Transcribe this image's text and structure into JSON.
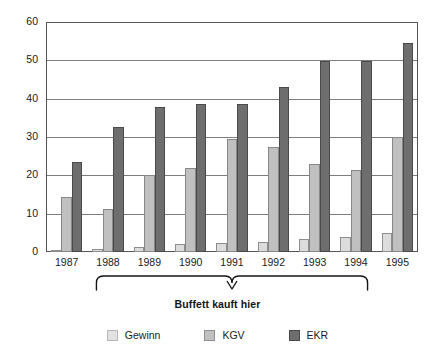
{
  "chart_data": {
    "type": "bar",
    "title": "",
    "subtitle": "",
    "xlabel": "",
    "ylabel": "",
    "ylim": [
      0,
      60
    ],
    "yticks": [
      0,
      10,
      20,
      30,
      40,
      50,
      60
    ],
    "ytick_labels": [
      "0",
      "10",
      "20",
      "30",
      "40",
      "50",
      "60"
    ],
    "grid": "horizontal",
    "legend_position": "bottom",
    "categories": [
      "1987",
      "1988",
      "1989",
      "1990",
      "1991",
      "1992",
      "1993",
      "1994",
      "1995"
    ],
    "series": [
      {
        "name": "Gewinn",
        "color": "#e2e2e2",
        "values": [
          0.6,
          0.9,
          1.3,
          2.0,
          2.4,
          2.6,
          3.3,
          3.9,
          4.9
        ]
      },
      {
        "name": "KGV",
        "color": "#c0c0c0",
        "values": [
          14.4,
          11.3,
          20.0,
          21.8,
          29.5,
          27.5,
          22.9,
          21.3,
          30.0
        ]
      },
      {
        "name": "EKR",
        "color": "#6e6e6e",
        "values": [
          23.5,
          32.5,
          37.8,
          38.5,
          38.6,
          43.1,
          49.8,
          49.8,
          54.5
        ]
      }
    ],
    "annotations": [
      {
        "text": "Buffett kauft hier",
        "type": "brace",
        "span_categories": [
          "1988",
          "1994"
        ]
      }
    ]
  },
  "legend": {
    "items": [
      {
        "label": "Gewinn",
        "swatch": "gewinn-swatch"
      },
      {
        "label": "KGV",
        "swatch": "kgv-swatch"
      },
      {
        "label": "EKR",
        "swatch": "ekr-swatch"
      }
    ]
  },
  "colors": {
    "gewinn": "#e2e2e2",
    "kgv": "#c0c0c0",
    "ekr": "#6e6e6e",
    "axis": "#555555",
    "grid": "#7d7d7d",
    "text": "#1a1a1a"
  }
}
